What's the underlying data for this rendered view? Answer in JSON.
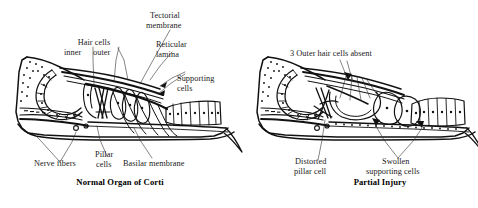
{
  "figure": {
    "background_color": "#ffffff",
    "ink_color": "#111111",
    "leader_color": "#333333",
    "type": "anatomical-line-drawing"
  },
  "panels": [
    {
      "id": "normal",
      "caption": "Normal Organ of Corti",
      "labels": [
        {
          "key": "hair_cells",
          "text": "Hair cells"
        },
        {
          "key": "inner",
          "text": "inner"
        },
        {
          "key": "outer",
          "text": "outer"
        },
        {
          "key": "tectorial_1",
          "text": "Tectorial"
        },
        {
          "key": "tectorial_2",
          "text": "membrane"
        },
        {
          "key": "reticular_1",
          "text": "Reticular"
        },
        {
          "key": "reticular_2",
          "text": "lamina"
        },
        {
          "key": "supporting_1",
          "text": "Supporting"
        },
        {
          "key": "supporting_2",
          "text": "cells"
        },
        {
          "key": "nerve_fibers",
          "text": "Nerve fibers"
        },
        {
          "key": "pillar_1",
          "text": "Pillar"
        },
        {
          "key": "pillar_2",
          "text": "cells"
        },
        {
          "key": "basilar_membrane",
          "text": "Basilar membrane"
        }
      ]
    },
    {
      "id": "injury",
      "caption": "Partial Injury",
      "labels": [
        {
          "key": "absent",
          "text": "3 Outer hair cells absent"
        },
        {
          "key": "distorted_1",
          "text": "Distorted"
        },
        {
          "key": "distorted_2",
          "text": "pillar cell"
        },
        {
          "key": "swollen_1",
          "text": "Swollen"
        },
        {
          "key": "swollen_2",
          "text": "supporting cells"
        }
      ]
    }
  ]
}
